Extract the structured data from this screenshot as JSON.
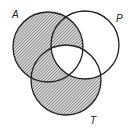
{
  "diagram": {
    "type": "venn-diagram",
    "sets": [
      {
        "id": "A",
        "label": "A",
        "cx": 48,
        "cy": 47,
        "r": 35,
        "label_x": 12,
        "label_y": 18
      },
      {
        "id": "P",
        "label": "P",
        "cx": 85,
        "cy": 45,
        "r": 34,
        "label_x": 116,
        "label_y": 22
      },
      {
        "id": "T",
        "label": "T",
        "cx": 66,
        "cy": 80,
        "r": 35,
        "label_x": 90,
        "label_y": 124
      }
    ],
    "shaded_regions": [
      "A only",
      "A∩P not T",
      "A∩T not P",
      "T only"
    ],
    "unshaded_regions": [
      "P only",
      "P∩T not A",
      "A∩P∩T"
    ],
    "shading_description": "(A ∪ T) − (P ∩ T)",
    "colors": {
      "stroke": "#222222",
      "hatch": "#555555",
      "background": "#ffffff"
    }
  }
}
